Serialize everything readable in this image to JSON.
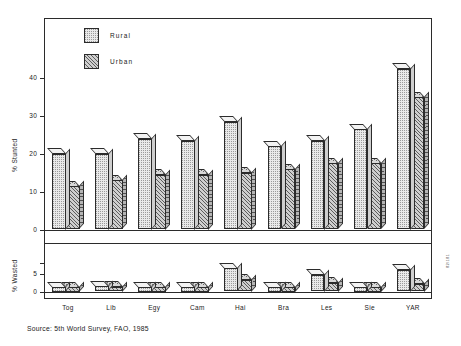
{
  "chart_data": {
    "type": "bar",
    "title": "",
    "subtitle": "",
    "source": "Source: 5th World Survey, FAO, 1985",
    "legend": {
      "position": "top-left",
      "entries": [
        {
          "name": "Rural",
          "fill": "stipple-light"
        },
        {
          "name": "Urban",
          "fill": "hatched-diagonal"
        }
      ]
    },
    "categories": [
      "Tog",
      "Lib",
      "Egy",
      "Cam",
      "Hai",
      "Bra",
      "Les",
      "Sie",
      "YAR"
    ],
    "panels": [
      {
        "id": "stunted",
        "ylabel": "% Stunted",
        "ylim": [
          0,
          45
        ],
        "yticks": [
          0,
          10,
          20,
          30,
          40
        ],
        "ytick_labels": [
          "0",
          "10",
          "20",
          "30",
          "40"
        ],
        "grid": false,
        "series": [
          {
            "name": "Rural",
            "values": [
              20.0,
              20.0,
              24.0,
              23.5,
              28.5,
              22.0,
              23.5,
              26.5,
              42.5
            ]
          },
          {
            "name": "Urban",
            "values": [
              11.5,
              13.0,
              14.5,
              14.5,
              15.0,
              16.0,
              17.5,
              17.5,
              35.0
            ]
          }
        ]
      },
      {
        "id": "wasted",
        "ylabel": "% Wasted",
        "ylim": [
          0,
          8
        ],
        "yticks": [
          0,
          5
        ],
        "ytick_labels": [
          "0",
          "5"
        ],
        "grid": false,
        "series": [
          {
            "name": "Rural",
            "values": [
              1.2,
              1.4,
              0.9,
              1.0,
              6.5,
              1.1,
              4.6,
              1.2,
              6.0
            ]
          },
          {
            "name": "Urban",
            "values": [
              1.0,
              1.3,
              0.9,
              1.0,
              3.2,
              1.1,
              2.4,
              1.2,
              2.2
            ]
          }
        ]
      }
    ],
    "xlabel": "",
    "side_code": "82/181"
  },
  "axis": {
    "stunted_title": "% Stunted",
    "wasted_title": "% Wasted"
  }
}
